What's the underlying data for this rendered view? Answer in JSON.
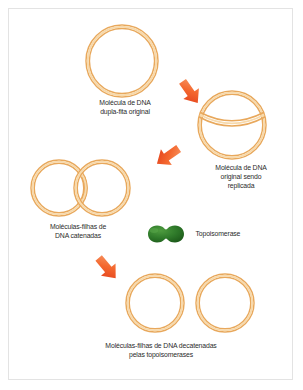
{
  "figure": {
    "background_color": "#ffffff",
    "border_color": "#e3e3e3",
    "dna_stroke_color": "#e8a85c",
    "dna_inner_color": "#f7d9ab",
    "arrow_color": "#f05a28",
    "arrow_color_dark": "#e03a18",
    "enzyme_color": "#2f7a2a",
    "enzyme_color_dark": "#1d5a1a",
    "text_color": "#2b2b2b"
  },
  "labels": {
    "original": "Molécula de DNA\ndupla-fita original",
    "replicating": "Molécula de DNA\noriginal sendo\nreplicada",
    "catenated": "Moléculas-filhas de\nDNA catenadas",
    "topoisomerase": "Topoisomerase",
    "decatenated": "Moléculas-filhas de DNA decatenadas\npelas topoisomerases"
  },
  "shapes": {
    "original_circle": {
      "cx": 122,
      "cy": 61,
      "r": 36
    },
    "replicating_circle": {
      "cx": 232,
      "cy": 125,
      "r": 34
    },
    "catenated_ring_left": {
      "cx": 59,
      "cy": 188,
      "r": 28
    },
    "catenated_ring_right": {
      "cx": 102,
      "cy": 188,
      "r": 28
    },
    "decatenated_ring_left": {
      "cx": 155,
      "cy": 303,
      "r": 29
    },
    "decatenated_ring_right": {
      "cx": 225,
      "cy": 303,
      "r": 29
    },
    "enzyme": {
      "cx": 166,
      "cy": 234,
      "rx": 18,
      "ry": 9
    }
  },
  "arrows": [
    {
      "name": "arrow-replication",
      "x": 190,
      "y": 92,
      "rotation": 55
    },
    {
      "name": "arrow-catenation",
      "x": 168,
      "y": 156,
      "rotation": 145
    },
    {
      "name": "arrow-decatenation",
      "x": 107,
      "y": 268,
      "rotation": 50
    }
  ]
}
